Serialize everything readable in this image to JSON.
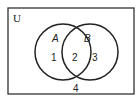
{
  "diagram": {
    "type": "venn",
    "universe_label": "U",
    "sets": [
      {
        "name": "A",
        "label": "A"
      },
      {
        "name": "B",
        "label": "B"
      }
    ],
    "regions": [
      {
        "id": "only-a",
        "label": "1"
      },
      {
        "id": "a-and-b",
        "label": "2"
      },
      {
        "id": "only-b",
        "label": "3"
      },
      {
        "id": "outside",
        "label": "4"
      }
    ],
    "colors": {
      "stroke": "#222222",
      "background": "#ffffff"
    }
  }
}
